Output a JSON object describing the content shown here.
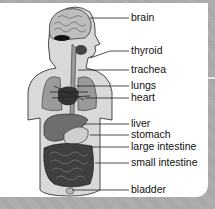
{
  "diagram": {
    "labels": [
      {
        "name": "brain",
        "text": "brain",
        "y": 12,
        "line_y": 18,
        "line_x1": 90
      },
      {
        "name": "thyroid",
        "text": "thyroid",
        "y": 45,
        "line_y": 51,
        "line_x1": 90
      },
      {
        "name": "trachea",
        "text": "trachea",
        "y": 64,
        "line_y": 70,
        "line_x1": 78
      },
      {
        "name": "lungs",
        "text": "lungs",
        "y": 80,
        "line_y": 86,
        "line_x1": 76
      },
      {
        "name": "heart",
        "text": "heart",
        "y": 92,
        "line_y": 98,
        "line_x1": 85
      },
      {
        "name": "liver",
        "text": "liver",
        "y": 118,
        "line_y": 124,
        "line_x1": 84
      },
      {
        "name": "stomach",
        "text": "stomach",
        "y": 129,
        "line_y": 135,
        "line_x1": 90
      },
      {
        "name": "large-intestine",
        "text": "large intestine",
        "y": 141,
        "line_y": 147,
        "line_x1": 90
      },
      {
        "name": "small-intestine",
        "text": "small intestine",
        "y": 157,
        "line_y": 163,
        "line_x1": 95
      },
      {
        "name": "bladder",
        "text": "bladder",
        "y": 184,
        "line_y": 190,
        "line_x1": 72
      }
    ],
    "colors": {
      "panel": "#ffffff",
      "background": "#adadad",
      "body_fill": "#d9d9d9",
      "organ_dark": "#3a3a3a",
      "organ_mid": "#8a8a8a",
      "line": "#222222"
    }
  }
}
